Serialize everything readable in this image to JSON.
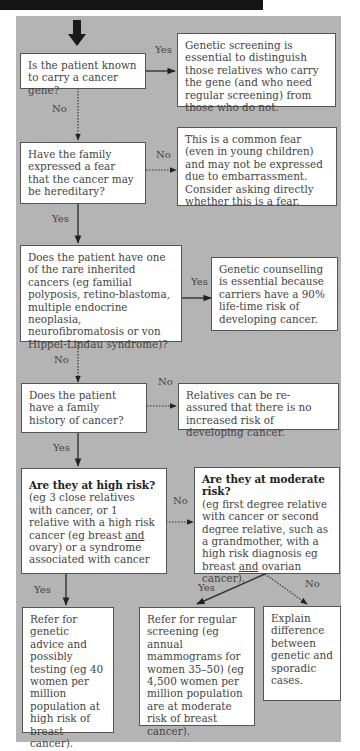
{
  "diagram": {
    "nodes": {
      "q1": "Is the patient known to carry a cancer gene?",
      "a1_yes": "Genetic screening is essential to distinguish those relatives who carry the gene (and who need regular screening) from those who do not.",
      "q2": "Have the family expressed a fear that the cancer may be hereditary?",
      "a2_no": "This is a common fear (even in young children) and may not be expressed due to embarrassment. Consider asking directly whether this is a fear.",
      "q3": "Does the patient have one of the rare inherited cancers (eg familial polyposis, retino-blastoma, multiple endocrine neoplasia, neurofibromatosis or von Hippel-Lindau syndrome)?",
      "a3_yes": "Genetic counselling is essential because carriers have a 90% life-time risk of developing cancer.",
      "q4": "Does the patient have a family history of cancer?",
      "a4_no": "Relatives can be re-assured that there is no increased risk of developing cancer.",
      "q5_title": "Are they at high risk?",
      "q5_body_1": "(eg 3 close relatives with cancer, or 1 relative with a high risk cancer (eg breast ",
      "q5_body_underline": "and",
      "q5_body_2": " ovary) or a syndrome associated with cancer",
      "q6_title": "Are they at moderate risk?",
      "q6_body_1": "(eg first degree relative with cancer or second degree relative, such as a grandmother, with a high risk diagnosis eg breast ",
      "q6_body_underline": "and",
      "q6_body_2": " ovarian cancer).",
      "a5_yes": "Refer for genetic advice and possibly testing (eg 40 women per million population at high risk of breast cancer).",
      "a6_yes": "Refer for regular screening (eg annual mammograms for women 35–50) (eg 4,500 women per million population are at moderate risk of breast cancer).",
      "a6_no": "Explain difference between genetic and sporadic cases."
    },
    "edge_labels": {
      "q1_yes": "Yes",
      "q1_no": "No",
      "q2_no": "No",
      "q2_yes": "Yes",
      "q3_yes": "Yes",
      "q3_no": "No",
      "q4_no": "No",
      "q4_yes": "Yes",
      "q5_no": "No",
      "q5_yes": "Yes",
      "q6_yes": "Yes",
      "q6_no": "No"
    },
    "colors": {
      "panel": "#b4b4b4",
      "box": "#ffffff",
      "topbar": "#151515"
    }
  }
}
